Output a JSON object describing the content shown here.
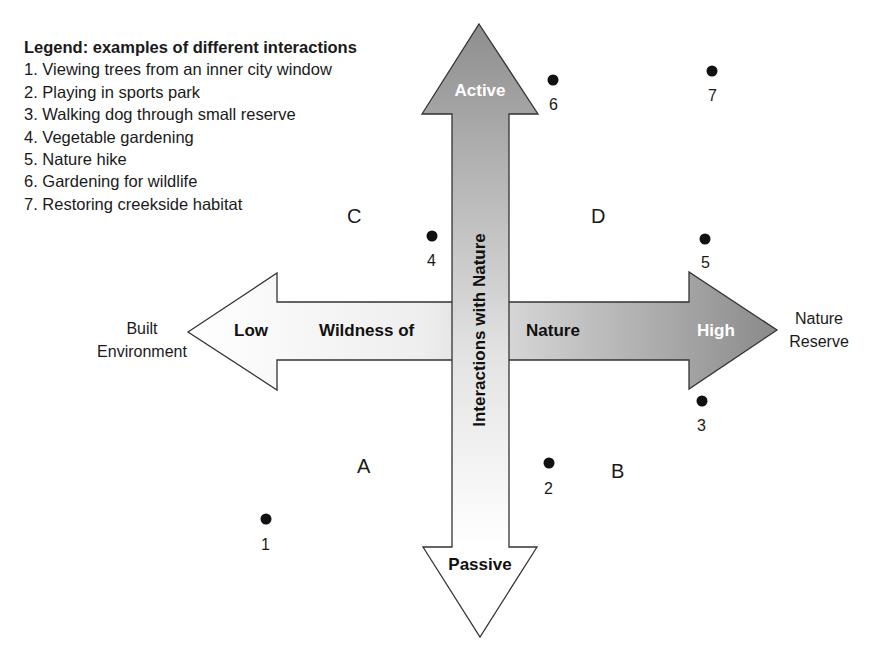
{
  "legend": {
    "title": "Legend: examples of different interactions",
    "items": [
      "1. Viewing trees from an inner city window",
      "2. Playing in sports park",
      "3. Walking dog through small reserve",
      "4. Vegetable gardening",
      "5. Nature hike",
      "6. Gardening for wildlife",
      "7. Restoring creekside habitat"
    ]
  },
  "axes": {
    "vertical": {
      "label": "Interactions with Nature",
      "top_label": "Active",
      "bottom_label": "Passive"
    },
    "horizontal": {
      "left_label": "Low",
      "mid_left_label": "Wildness of",
      "mid_right_label": "Nature",
      "right_label": "High",
      "left_end": [
        "Built",
        "Environment"
      ],
      "right_end": [
        "Nature",
        "Reserve"
      ]
    }
  },
  "quadrants": {
    "top_left": "C",
    "top_right": "D",
    "bottom_left": "A",
    "bottom_right": "B"
  },
  "points": [
    {
      "label": "1",
      "x": 266,
      "y": 519
    },
    {
      "label": "2",
      "x": 549,
      "y": 463
    },
    {
      "label": "3",
      "x": 702,
      "y": 401
    },
    {
      "label": "4",
      "x": 432,
      "y": 236
    },
    {
      "label": "5",
      "x": 705,
      "y": 239
    },
    {
      "label": "6",
      "x": 553,
      "y": 80
    },
    {
      "label": "7",
      "x": 712,
      "y": 71
    }
  ],
  "colors": {
    "dark_gray": "#8f8f8f",
    "light": "#ffffff",
    "stroke": "#333333"
  }
}
